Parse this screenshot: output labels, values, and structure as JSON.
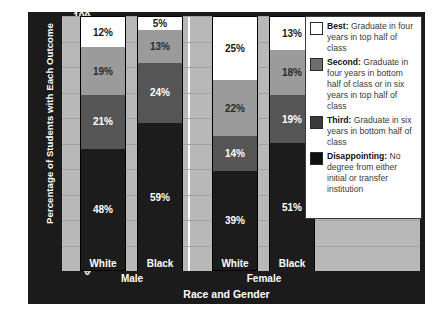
{
  "chart_data": {
    "type": "bar",
    "subtype": "stacked-100-percent",
    "title": "",
    "xlabel": "Race and Gender",
    "ylabel": "Percentage of Students with Each Outcome",
    "ylim": [
      0,
      100
    ],
    "yticks": [
      0,
      10,
      20,
      30,
      40,
      50,
      60,
      70,
      80,
      90,
      100
    ],
    "grid": true,
    "legend_position": "right-inside",
    "categories": [
      "White",
      "Black",
      "White",
      "Black"
    ],
    "groups": [
      {
        "name": "Male",
        "categories": [
          "White",
          "Black"
        ]
      },
      {
        "name": "Female",
        "categories": [
          "White",
          "Black"
        ]
      }
    ],
    "series": [
      {
        "name": "Best",
        "color": "#ffffff",
        "values": [
          12,
          5,
          25,
          13
        ],
        "label": "Best: Graduate in four years in top half of class"
      },
      {
        "name": "Second",
        "color": "#9b9b9b",
        "values": [
          19,
          13,
          22,
          18
        ],
        "label": "Second: Graduate in four years in bottom half of class or in six years in top half of class"
      },
      {
        "name": "Third",
        "color": "#565656",
        "values": [
          21,
          24,
          14,
          19
        ],
        "label": "Third: Graduate in six years in bottom half of class"
      },
      {
        "name": "Disappointing",
        "color": "#1c1c1c",
        "values": [
          48,
          59,
          39,
          51
        ],
        "label": "Disappointing: No degree from either initial or transfer institution"
      }
    ],
    "bars": [
      {
        "group": "Male",
        "race": "White",
        "segments": [
          {
            "series": "Disappointing",
            "value": 48,
            "label": "48%"
          },
          {
            "series": "Third",
            "value": 21,
            "label": "21%"
          },
          {
            "series": "Second",
            "value": 19,
            "label": "19%"
          },
          {
            "series": "Best",
            "value": 12,
            "label": "12%"
          }
        ]
      },
      {
        "group": "Male",
        "race": "Black",
        "segments": [
          {
            "series": "Disappointing",
            "value": 59,
            "label": "59%"
          },
          {
            "series": "Third",
            "value": 24,
            "label": "24%"
          },
          {
            "series": "Second",
            "value": 13,
            "label": "13%"
          },
          {
            "series": "Best",
            "value": 5,
            "label": "5%"
          }
        ]
      },
      {
        "group": "Female",
        "race": "White",
        "segments": [
          {
            "series": "Disappointing",
            "value": 39,
            "label": "39%"
          },
          {
            "series": "Third",
            "value": 14,
            "label": "14%"
          },
          {
            "series": "Second",
            "value": 22,
            "label": "22%"
          },
          {
            "series": "Best",
            "value": 25,
            "label": "25%"
          }
        ]
      },
      {
        "group": "Female",
        "race": "Black",
        "segments": [
          {
            "series": "Disappointing",
            "value": 51,
            "label": "51%"
          },
          {
            "series": "Third",
            "value": 19,
            "label": "19%"
          },
          {
            "series": "Second",
            "value": 18,
            "label": "18%"
          },
          {
            "series": "Best",
            "value": 13,
            "label": "13%"
          }
        ]
      }
    ]
  },
  "axes": {
    "y_title": "Percentage of Students with Each Outcome",
    "x_title": "Race and Gender",
    "y_ticks": [
      "100",
      "90",
      "80",
      "70",
      "60",
      "50",
      "40",
      "30",
      "20",
      "10",
      "0"
    ],
    "x_categories": [
      "White",
      "Black",
      "White",
      "Black"
    ],
    "x_groups": [
      "Male",
      "Female"
    ]
  },
  "legend": {
    "items": [
      {
        "key": "best",
        "title": "Best:",
        "text": " Graduate in four years in top half of class"
      },
      {
        "key": "second",
        "title": "Second:",
        "text": " Graduate in four years in bottom half of class or in six years in top half of class"
      },
      {
        "key": "third",
        "title": "Third:",
        "text": " Graduate in six years in bottom half of class"
      },
      {
        "key": "disappointing",
        "title": "Disappointing:",
        "text": " No degree from either initial or transfer institution"
      }
    ]
  },
  "colors": {
    "panel_background": "#1b1b1b",
    "plot_background": "#b8b8b8",
    "best": "#ffffff",
    "second": "#9b9b9b",
    "third": "#565656",
    "disappointing": "#1c1c1c",
    "text_on_dark": "#ffffff"
  }
}
